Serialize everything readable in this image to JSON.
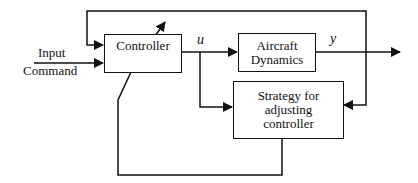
{
  "diagram": {
    "type": "block-diagram",
    "blocks": {
      "controller": {
        "label": "Controller"
      },
      "aircraft": {
        "label": "Aircraft\nDynamics",
        "line1": "Aircraft",
        "line2": "Dynamics"
      },
      "strategy": {
        "label": "Strategy for adjusting controller",
        "line1": "Strategy for",
        "line2": "adjusting",
        "line3": "controller"
      }
    },
    "labels": {
      "input_line1": "Input",
      "input_line2": "Command",
      "u": "u",
      "y": "y"
    },
    "edges": [
      {
        "from": "input",
        "to": "controller"
      },
      {
        "from": "controller",
        "to": "aircraft",
        "signal": "u"
      },
      {
        "from": "controller",
        "to": "strategy",
        "signal": "u"
      },
      {
        "from": "aircraft",
        "to": "output",
        "signal": "y"
      },
      {
        "from": "output",
        "to": "controller",
        "type": "feedback"
      },
      {
        "from": "output",
        "to": "strategy"
      },
      {
        "from": "strategy",
        "to": "controller",
        "type": "adjustment"
      }
    ]
  }
}
